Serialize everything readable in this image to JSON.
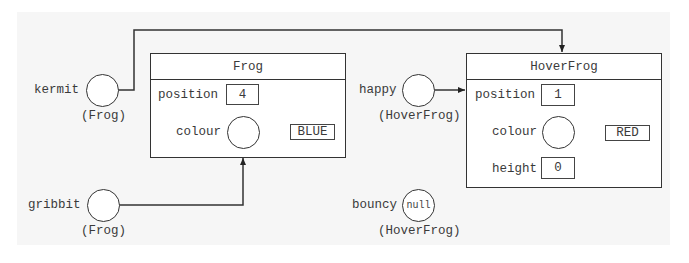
{
  "diagram": {
    "type": "object-reference-diagram",
    "variables": [
      {
        "name": "kermit",
        "type_label": "(Frog)",
        "value": "",
        "points_to": "frog_object"
      },
      {
        "name": "gribbit",
        "type_label": "(Frog)",
        "value": "",
        "points_to": "frog_object.colour"
      },
      {
        "name": "happy",
        "type_label": "(HoverFrog)",
        "value": "",
        "points_to": "hoverfrog_object"
      },
      {
        "name": "bouncy",
        "type_label": "(HoverFrog)",
        "value": "null",
        "points_to": null
      }
    ],
    "objects": {
      "frog": {
        "class_name": "Frog",
        "fields": {
          "position": {
            "label": "position",
            "value": "4"
          },
          "colour": {
            "label": "colour",
            "value": "BLUE"
          }
        }
      },
      "hoverfrog": {
        "class_name": "HoverFrog",
        "fields": {
          "position": {
            "label": "position",
            "value": "1"
          },
          "colour": {
            "label": "colour",
            "value": "RED"
          },
          "height": {
            "label": "height",
            "value": "0"
          }
        }
      }
    },
    "colors": {
      "background": "#ffffff",
      "panel": "#f6f6f6",
      "stroke": "#333333",
      "text": "#3a3a3a"
    }
  }
}
